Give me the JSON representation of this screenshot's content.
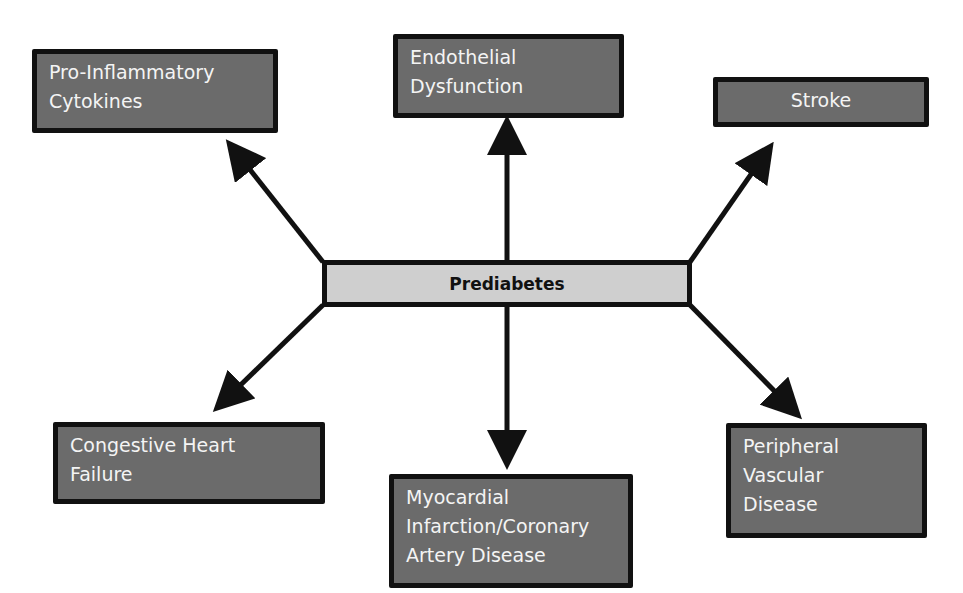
{
  "diagram": {
    "center": {
      "label": "Prediabetes"
    },
    "nodes": [
      {
        "id": "pro-inflammatory",
        "lines": [
          "Pro-Inflammatory",
          "Cytokines"
        ]
      },
      {
        "id": "endothelial",
        "lines": [
          "Endothelial",
          "Dysfunction"
        ]
      },
      {
        "id": "stroke",
        "lines": [
          "Stroke"
        ]
      },
      {
        "id": "chf",
        "lines": [
          "Congestive Heart",
          "Failure"
        ]
      },
      {
        "id": "mi-cad",
        "lines": [
          "Myocardial",
          "Infarction/Coronary",
          "Artery Disease"
        ]
      },
      {
        "id": "pvd",
        "lines": [
          "Peripheral",
          "Vascular",
          "Disease"
        ]
      }
    ],
    "colors": {
      "box_fill": "#6b6b6b",
      "box_border": "#111111",
      "center_fill": "#cfcfcf",
      "text_light": "#f4f4f4",
      "arrow": "#111111"
    }
  }
}
